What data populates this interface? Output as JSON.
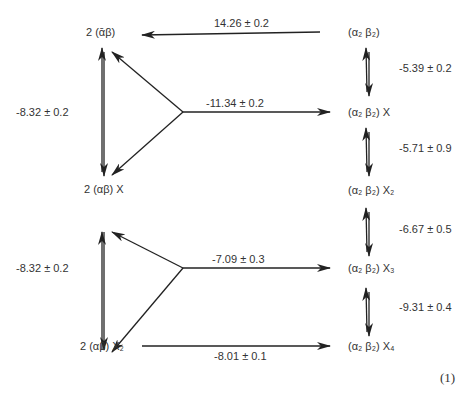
{
  "species": {
    "left_top": "2 (ᾱβ)",
    "left_mid": "2 (αβ) X",
    "left_bot": "2 (αβ) X₂",
    "right_0": "(α₂ β₂)",
    "right_1": "(α₂ β₂) X",
    "right_2": "(α₂ β₂) X₂",
    "right_3": "(α₂ β₂) X₃",
    "right_4": "(α₂ β₂) X₄"
  },
  "constants": {
    "top_horizontal": "14.26 ± 0.2",
    "mid_horizontal_upper": "-11.34 ± 0.2",
    "mid_horizontal_lower": "-7.09 ± 0.3",
    "bottom_horizontal": "-8.01 ± 0.1",
    "left_upper_vertical": "-8.32 ± 0.2",
    "left_lower_vertical": "-8.32 ± 0.2",
    "right_0_1": "-5.39 ± 0.2",
    "right_1_2": "-5.71 ± 0.9",
    "right_2_3": "-6.67 ± 0.5",
    "right_3_4": "-9.31 ± 0.4"
  },
  "equation_number": "(1)"
}
